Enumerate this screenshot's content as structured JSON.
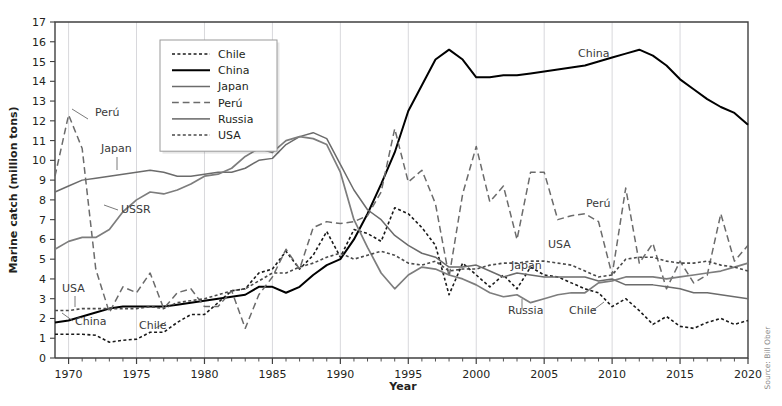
{
  "chart_data": {
    "type": "line",
    "title": "",
    "xlabel": "Year",
    "ylabel": "Marine catch (million tons)",
    "xlim": [
      1969,
      2020
    ],
    "ylim": [
      0,
      17
    ],
    "xticks": [
      1970,
      1975,
      1980,
      1985,
      1990,
      1995,
      2000,
      2005,
      2010,
      2015,
      2020
    ],
    "xtick_labels": [
      "1970",
      "1975",
      "1980",
      "1985",
      "1990",
      "1995",
      "2000",
      "2005",
      "2010",
      "2015",
      "2020"
    ],
    "yticks": [
      0,
      1,
      2,
      3,
      4,
      5,
      6,
      7,
      8,
      9,
      10,
      11,
      12,
      13,
      14,
      15,
      16,
      17
    ],
    "ytick_labels": [
      "0",
      "1",
      "2",
      "3",
      "4",
      "5",
      "6",
      "7",
      "8",
      "9",
      "10",
      "11",
      "12",
      "13",
      "14",
      "15",
      "16",
      "17"
    ],
    "grid": "vertical-major-only",
    "legend_position": "top-center-left",
    "x": [
      1969,
      1970,
      1971,
      1972,
      1973,
      1974,
      1975,
      1976,
      1977,
      1978,
      1979,
      1980,
      1981,
      1982,
      1983,
      1984,
      1985,
      1986,
      1987,
      1988,
      1989,
      1990,
      1991,
      1992,
      1993,
      1994,
      1995,
      1996,
      1997,
      1998,
      1999,
      2000,
      2001,
      2002,
      2003,
      2004,
      2005,
      2006,
      2007,
      2008,
      2009,
      2010,
      2011,
      2012,
      2013,
      2014,
      2015,
      2016,
      2017,
      2018,
      2019,
      2020
    ],
    "series": [
      {
        "name": "Chile",
        "style": "dotted",
        "color": "#1a1a1a",
        "width": 1.6,
        "values": [
          1.2,
          1.2,
          1.2,
          1.15,
          0.8,
          0.9,
          0.95,
          1.3,
          1.3,
          1.8,
          2.2,
          2.2,
          2.8,
          3.4,
          3.5,
          4.3,
          4.5,
          5.4,
          4.5,
          5.2,
          6.4,
          5.1,
          6.5,
          6.3,
          5.9,
          7.6,
          7.3,
          6.6,
          5.7,
          3.2,
          4.8,
          4.2,
          3.6,
          4.2,
          3.5,
          4.6,
          4.2,
          4.1,
          3.8,
          3.5,
          3.3,
          2.6,
          3.0,
          2.4,
          1.7,
          2.1,
          1.6,
          1.5,
          1.8,
          2.0,
          1.7,
          1.9
        ]
      },
      {
        "name": "China",
        "style": "solid",
        "color": "#000000",
        "width": 2.0,
        "values": [
          1.8,
          1.9,
          2.1,
          2.3,
          2.5,
          2.6,
          2.6,
          2.6,
          2.6,
          2.7,
          2.8,
          2.9,
          3.0,
          3.1,
          3.2,
          3.6,
          3.6,
          3.3,
          3.6,
          4.2,
          4.7,
          5.0,
          6.0,
          7.3,
          8.8,
          10.4,
          12.5,
          13.8,
          15.1,
          15.6,
          15.1,
          14.2,
          14.2,
          14.3,
          14.3,
          14.4,
          14.5,
          14.6,
          14.7,
          14.8,
          15.0,
          15.2,
          15.4,
          15.6,
          15.3,
          14.8,
          14.1,
          13.6,
          13.1,
          12.7,
          12.4,
          11.8
        ]
      },
      {
        "name": "Japan",
        "style": "solid",
        "color": "#6b6b6b",
        "width": 1.5,
        "values": [
          8.4,
          8.7,
          9.0,
          9.1,
          9.2,
          9.3,
          9.4,
          9.5,
          9.4,
          9.2,
          9.2,
          9.3,
          9.4,
          9.4,
          9.6,
          10.0,
          10.1,
          10.8,
          11.2,
          11.4,
          11.1,
          9.8,
          8.5,
          7.5,
          7.0,
          6.2,
          5.7,
          5.3,
          5.1,
          4.6,
          4.6,
          4.7,
          4.4,
          4.1,
          4.3,
          4.2,
          4.1,
          4.1,
          4.1,
          4.1,
          3.9,
          4.0,
          3.7,
          3.7,
          3.7,
          3.6,
          3.5,
          3.3,
          3.3,
          3.2,
          3.1,
          3.0
        ]
      },
      {
        "name": "Perú",
        "style": "dashed",
        "color": "#6b6b6b",
        "width": 1.5,
        "values": [
          9.2,
          12.3,
          10.6,
          4.5,
          2.3,
          3.6,
          3.3,
          4.3,
          2.5,
          3.3,
          3.5,
          2.6,
          2.6,
          3.4,
          1.5,
          3.2,
          4.1,
          5.5,
          4.5,
          6.6,
          6.9,
          6.8,
          6.9,
          7.2,
          8.4,
          11.6,
          8.9,
          9.5,
          7.8,
          4.1,
          8.3,
          10.7,
          7.9,
          8.7,
          6.0,
          9.4,
          9.4,
          7.0,
          7.2,
          7.3,
          6.9,
          4.2,
          8.6,
          4.8,
          5.8,
          3.5,
          4.9,
          3.8,
          4.2,
          7.3,
          4.9,
          5.7
        ]
      },
      {
        "name": "Russia",
        "style": "solid",
        "color": "#7d7d7d",
        "width": 1.7,
        "values": [
          5.5,
          5.9,
          6.1,
          6.1,
          6.5,
          7.4,
          8.0,
          8.4,
          8.3,
          8.5,
          8.8,
          9.2,
          9.3,
          9.6,
          10.2,
          10.6,
          10.4,
          11.0,
          11.2,
          11.1,
          10.8,
          9.4,
          7.0,
          5.6,
          4.3,
          3.5,
          4.2,
          4.6,
          4.5,
          4.2,
          4.0,
          3.7,
          3.3,
          3.1,
          3.2,
          2.8,
          3.0,
          3.2,
          3.3,
          3.3,
          3.8,
          3.9,
          4.1,
          4.1,
          4.1,
          4.0,
          4.1,
          4.2,
          4.3,
          4.4,
          4.6,
          4.8
        ]
      },
      {
        "name": "USA",
        "style": "dotted",
        "color": "#4a4a4a",
        "width": 1.6,
        "values": [
          2.4,
          2.4,
          2.5,
          2.5,
          2.5,
          2.5,
          2.5,
          2.6,
          2.5,
          2.8,
          2.9,
          3.0,
          3.2,
          3.4,
          3.5,
          3.9,
          4.3,
          4.3,
          4.6,
          4.8,
          5.1,
          5.3,
          5.0,
          5.2,
          5.4,
          5.2,
          4.8,
          4.7,
          4.9,
          4.4,
          4.5,
          4.5,
          4.7,
          4.8,
          4.8,
          4.9,
          4.9,
          4.8,
          4.7,
          4.4,
          4.1,
          4.2,
          5.0,
          5.1,
          5.1,
          4.9,
          4.8,
          4.8,
          4.9,
          4.7,
          4.6,
          4.4
        ]
      }
    ],
    "annotations": [
      {
        "label": "Perú",
        "x": 95,
        "y": 116,
        "leader": [
          [
            88,
            119
          ],
          [
            72,
            109
          ]
        ]
      },
      {
        "label": "Japan",
        "x": 101,
        "y": 152,
        "leader": [
          [
            117,
            157
          ],
          [
            117,
            170
          ]
        ]
      },
      {
        "label": "USSR",
        "x": 121,
        "y": 213,
        "leader": [
          [
            118,
            210
          ],
          [
            104,
            205
          ]
        ]
      },
      {
        "label": "USA",
        "x": 62,
        "y": 292,
        "leader": [
          [
            75,
            296
          ],
          [
            75,
            307
          ]
        ]
      },
      {
        "label": "China",
        "x": 75,
        "y": 325,
        "leader": [
          [
            73,
            321
          ],
          [
            62,
            313
          ]
        ]
      },
      {
        "label": "Chile",
        "x": 139,
        "y": 329,
        "leader": [
          [
            156,
            328
          ],
          [
            166,
            322
          ]
        ]
      },
      {
        "label": "China",
        "x": 578,
        "y": 57,
        "leader": []
      },
      {
        "label": "Perú",
        "x": 586,
        "y": 207,
        "leader": []
      },
      {
        "label": "USA",
        "x": 548,
        "y": 248,
        "leader": []
      },
      {
        "label": "Japan",
        "x": 511,
        "y": 269,
        "leader": []
      },
      {
        "label": "Russia",
        "x": 508,
        "y": 314,
        "leader": [
          [
            522,
            309
          ],
          [
            522,
            299
          ]
        ]
      },
      {
        "label": "Chile",
        "x": 569,
        "y": 314,
        "leader": [
          [
            592,
            311
          ],
          [
            604,
            302
          ]
        ]
      }
    ],
    "legend_entries": [
      {
        "label": "Chile",
        "style": "dotted",
        "color": "#1a1a1a"
      },
      {
        "label": "China",
        "style": "solid",
        "color": "#000000"
      },
      {
        "label": "Japan",
        "style": "solid",
        "color": "#6b6b6b"
      },
      {
        "label": "Perú",
        "style": "dashed",
        "color": "#6b6b6b"
      },
      {
        "label": "Russia",
        "style": "solid",
        "color": "#7d7d7d"
      },
      {
        "label": "USA",
        "style": "dotted",
        "color": "#4a4a4a"
      }
    ],
    "source": "Source: Bill Ober"
  }
}
